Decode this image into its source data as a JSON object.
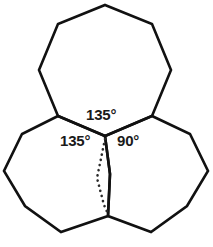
{
  "figure": {
    "background_color": "#ffffff",
    "stroke_color": "#111111",
    "label_color": "#1a1a1a",
    "dotted_color": "#2a2a2a",
    "width": 213,
    "height": 247
  },
  "labels": {
    "top_angle": "135°",
    "left_angle": "135°",
    "right_angle": "90°"
  },
  "caption": {
    "text": ""
  },
  "chart_data": {
    "type": "diagram",
    "shapes": [
      {
        "name": "top-octagon",
        "sides": 8,
        "interior_angle": 135,
        "points": "105,5 152,24 171,70 152,116 105,136 58,116 39,70 58,24"
      },
      {
        "name": "left-octagon",
        "sides": 8,
        "interior_angle": 135,
        "points": "58,116 105,136 110,174 108,216 61,232 25,206 4,171 22,134"
      },
      {
        "name": "right-octagon",
        "sides": 8,
        "interior_angle": 90,
        "points": "152,116 190,134 208,171 187,206 151,232 108,216 110,174 105,136"
      }
    ],
    "central_vertex": {
      "x": 105,
      "y": 136
    },
    "bottom_vertex": {
      "x": 108,
      "y": 216
    },
    "angles_at_central_vertex": [
      {
        "label": "135°",
        "value": 135,
        "position": "top",
        "belongs_to": "top-octagon"
      },
      {
        "label": "135°",
        "value": 135,
        "position": "left",
        "belongs_to": "left-octagon"
      },
      {
        "label": "90°",
        "value": 90,
        "position": "right",
        "belongs_to": "gap"
      }
    ],
    "angle_sum": 360,
    "dotted_guide": {
      "description": "dotted line from central vertex to bottom vertex bounding the 90-degree gap",
      "points": "105,139 97,178 104,205 108,214"
    }
  }
}
